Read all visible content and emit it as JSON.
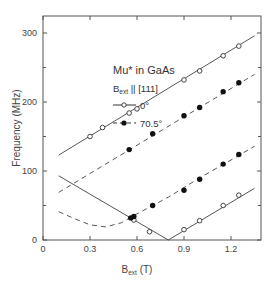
{
  "chart_data": {
    "type": "scatter",
    "title": "Mu* in GaAs",
    "subtitle": "B_ext || [111]",
    "xlabel": "B_ext (T)",
    "ylabel": "Frequency (MHz)",
    "xlim": [
      0,
      1.38
    ],
    "ylim": [
      0,
      325
    ],
    "xticks": [
      0,
      0.3,
      0.6,
      0.9,
      1.2
    ],
    "xtick_labels": [
      "0",
      "0.3",
      "0.6",
      "0.9",
      "1.2"
    ],
    "yticks": [
      0,
      100,
      200,
      300
    ],
    "ytick_labels": [
      "0",
      "100",
      "200",
      "300"
    ],
    "grid": false,
    "legend_position": "upper-left-inside",
    "legend": [
      {
        "label": "0°",
        "marker": "open-circle",
        "line": "solid"
      },
      {
        "label": "70.5°",
        "marker": "filled-circle",
        "line": "dashed"
      }
    ],
    "series": [
      {
        "name": "0° upper branch",
        "marker": "open-circle",
        "line": "solid",
        "points": [
          [
            0.3,
            150
          ],
          [
            0.38,
            163
          ],
          [
            0.55,
            184
          ],
          [
            0.6,
            190
          ],
          [
            0.9,
            232
          ],
          [
            1.0,
            245
          ],
          [
            1.15,
            267
          ],
          [
            1.25,
            281
          ]
        ],
        "fit": [
          [
            0.1,
            123
          ],
          [
            1.35,
            296
          ]
        ]
      },
      {
        "name": "0° lower branch",
        "marker": "open-circle",
        "line": "solid",
        "points": [
          [
            0.58,
            29
          ],
          [
            0.68,
            12
          ],
          [
            0.9,
            15
          ],
          [
            1.0,
            28
          ],
          [
            1.15,
            50
          ],
          [
            1.25,
            65
          ]
        ],
        "fit": [
          [
            0.1,
            93
          ],
          [
            0.8,
            0
          ],
          [
            1.35,
            75
          ]
        ]
      },
      {
        "name": "70.5° upper branch",
        "marker": "filled-circle",
        "line": "dashed",
        "points": [
          [
            0.55,
            131
          ],
          [
            0.7,
            154
          ],
          [
            0.9,
            180
          ],
          [
            1.0,
            192
          ],
          [
            1.15,
            215
          ],
          [
            1.25,
            228
          ]
        ],
        "fit": [
          [
            0.1,
            69
          ],
          [
            1.35,
            240
          ]
        ]
      },
      {
        "name": "70.5° lower branch",
        "marker": "filled-circle",
        "line": "dashed",
        "points": [
          [
            0.56,
            32
          ],
          [
            0.58,
            34
          ],
          [
            0.7,
            50
          ],
          [
            0.9,
            72
          ],
          [
            1.0,
            88
          ],
          [
            1.15,
            110
          ],
          [
            1.25,
            124
          ]
        ],
        "fit": [
          [
            0.1,
            41
          ],
          [
            0.2,
            31
          ],
          [
            0.3,
            22
          ],
          [
            0.4,
            19
          ],
          [
            0.5,
            25
          ],
          [
            0.6,
            38
          ],
          [
            0.8,
            62
          ],
          [
            1.0,
            90
          ],
          [
            1.2,
            116
          ],
          [
            1.35,
            136
          ]
        ]
      }
    ]
  },
  "labels": {
    "title": "Mu* in GaAs",
    "field_B": "B",
    "field_sub": "ext",
    "field_rest": " || [111]",
    "legend_0": "0°",
    "legend_70": "70.5°",
    "xlabel_B": "B",
    "xlabel_sub": "ext",
    "xlabel_rest": " (T)",
    "ylabel": "Frequency (MHz)"
  }
}
